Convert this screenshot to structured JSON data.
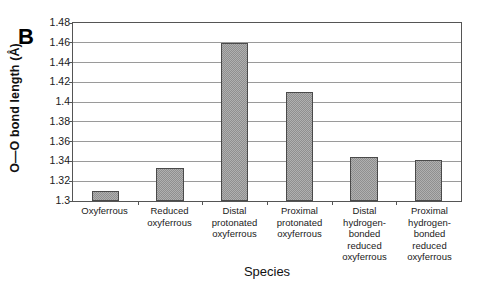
{
  "chart_data": {
    "type": "bar",
    "title": "",
    "panel_label": "B",
    "xlabel": "Species",
    "ylabel": "O—O bond length (Å)",
    "categories": [
      "Oxyferrous",
      "Reduced oxyferrous",
      "Distal protonated oxyferrous",
      "Proximal protonated oxyferrous",
      "Distal hydrogen-bonded reduced oxyferrous",
      "Proximal hydrogen-bonded reduced oxyferrous"
    ],
    "category_lines": [
      [
        "Oxyferrous"
      ],
      [
        "Reduced",
        "oxyferrous"
      ],
      [
        "Distal",
        "protonated",
        "oxyferrous"
      ],
      [
        "Proximal",
        "protonated",
        "oxyferrous"
      ],
      [
        "Distal",
        "hydrogen-",
        "bonded",
        "reduced",
        "oxyferrous"
      ],
      [
        "Proximal",
        "hydrogen-",
        "bonded",
        "reduced",
        "oxyferrous"
      ]
    ],
    "values": [
      1.31,
      1.333,
      1.46,
      1.41,
      1.345,
      1.341
    ],
    "ylim": [
      1.3,
      1.48
    ],
    "ytick_step": 0.02,
    "yticks": [
      "1.48",
      "1.46",
      "1.44",
      "1.42",
      "1.4",
      "1.38",
      "1.36",
      "1.34",
      "1.32",
      "1.3"
    ],
    "ytick_values": [
      1.48,
      1.46,
      1.44,
      1.42,
      1.4,
      1.38,
      1.36,
      1.34,
      1.32,
      1.3
    ],
    "grid": true,
    "legend": false,
    "bar_fill_color": "#b0b0b0",
    "bar_edge_color": "#4a4a4a",
    "gridline_color": "#9a9a9a",
    "axis_color": "#555555",
    "background_color": "#ffffff"
  }
}
